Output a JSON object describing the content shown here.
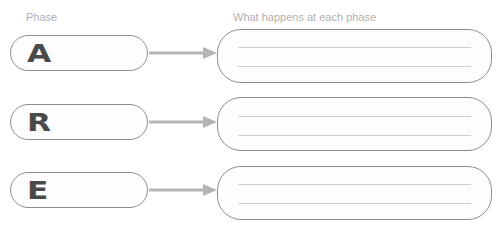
{
  "headers": {
    "phase": "Phase",
    "what_happens": "What happens at each phase"
  },
  "rows": [
    {
      "letter": "A",
      "answer_lines": [
        "",
        ""
      ]
    },
    {
      "letter": "R",
      "answer_lines": [
        "",
        ""
      ]
    },
    {
      "letter": "E",
      "answer_lines": [
        "",
        ""
      ]
    }
  ],
  "colors": {
    "border": "#8e8e8e",
    "arrow": "#b5b5b5",
    "letter": "#4a4a4a",
    "header_text": "#b0b0b0"
  }
}
